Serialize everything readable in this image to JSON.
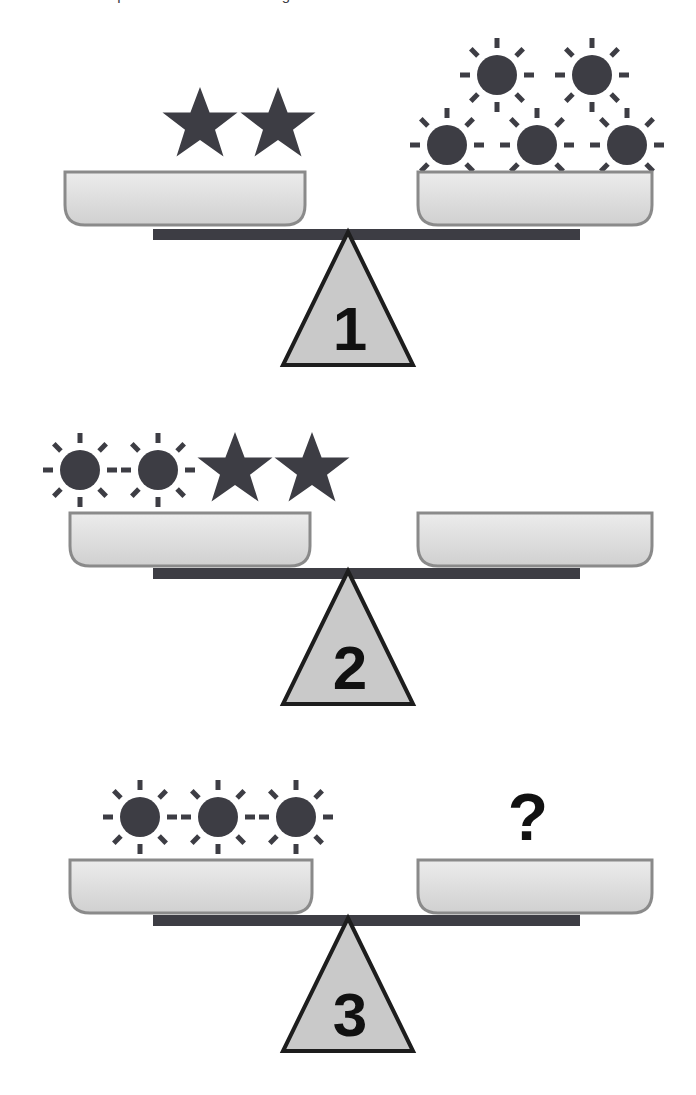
{
  "header": {
    "clipped_text": "A balance scale puzzle · find the missing value"
  },
  "colors": {
    "icon_dark": "#3d3d44",
    "pan_fill_top": "#e8e8e8",
    "pan_fill_bottom": "#d2d2d2",
    "pan_stroke": "#8a8a8a",
    "beam": "#3d3d44",
    "fulcrum_fill": "#c9c9c9",
    "fulcrum_stroke": "#1d1d1d",
    "text_dark": "#111111",
    "background": "#ffffff"
  },
  "puzzle": {
    "type": "balance-scale-equations",
    "symbols": [
      "moon",
      "star",
      "sun"
    ],
    "scales": [
      {
        "number": "1",
        "left_items": [
          "moon",
          "star",
          "star"
        ],
        "right_items": [
          "sun",
          "sun",
          "sun",
          "sun",
          "sun"
        ],
        "left_counts": {
          "moon": 1,
          "star": 2,
          "sun": 0
        },
        "right_counts": {
          "moon": 0,
          "star": 0,
          "sun": 5
        },
        "state": "balanced",
        "right_is_unknown": false
      },
      {
        "number": "2",
        "left_items": [
          "sun",
          "sun",
          "star",
          "star"
        ],
        "right_items": [
          "moon",
          "moon"
        ],
        "left_counts": {
          "moon": 0,
          "star": 2,
          "sun": 2
        },
        "right_counts": {
          "moon": 2,
          "star": 0,
          "sun": 0
        },
        "state": "balanced",
        "right_is_unknown": false
      },
      {
        "number": "3",
        "left_items": [
          "moon",
          "sun",
          "sun",
          "sun"
        ],
        "right_items": [],
        "left_counts": {
          "moon": 1,
          "star": 0,
          "sun": 3
        },
        "right_counts": {
          "moon": 0,
          "star": 0,
          "sun": 0
        },
        "state": "balanced",
        "right_is_unknown": true,
        "unknown_label": "?"
      }
    ]
  }
}
